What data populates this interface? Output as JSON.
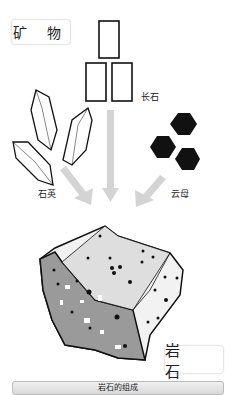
{
  "title_minerals": "矿 物",
  "title_rock": "岩 石",
  "minerals": [
    {
      "name": "长石",
      "shape": "rectangles"
    },
    {
      "name": "石英",
      "shape": "crystal-prisms"
    },
    {
      "name": "云母",
      "shape": "hexagons"
    }
  ],
  "caption": "岩石的组成",
  "colors": {
    "arrow": "#d4d4d4",
    "outline": "#111111",
    "rock_dark": "#9a9a9a",
    "rock_light": "#e8e8e8"
  }
}
